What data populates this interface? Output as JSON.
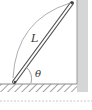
{
  "diagram": {
    "labels": {
      "length": "L",
      "angle": "θ"
    },
    "colors": {
      "wall": "#d4d4d4",
      "wall_edge": "#9a9a9a",
      "floor_hatch": "#7a7a7a",
      "rod": "#555555",
      "arc": "#8a8a8a",
      "dashed_line": "#c8c8c8"
    },
    "elements": [
      "wall",
      "floor",
      "rod",
      "length-arc",
      "angle-arc",
      "dashed-divider"
    ]
  }
}
